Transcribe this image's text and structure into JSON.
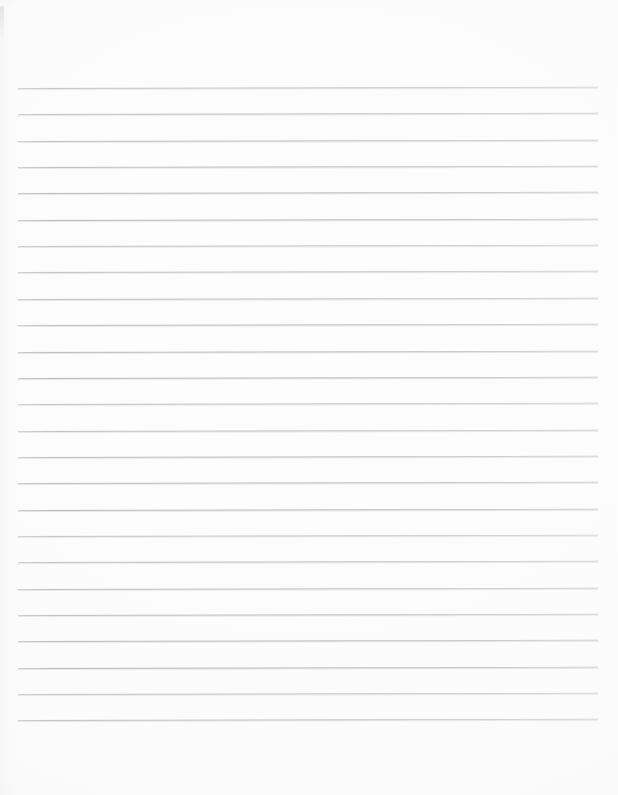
{
  "document": {
    "kind": "scanned-lined-paper",
    "title": "Blank Ruled Notebook Page",
    "page_width": 618,
    "page_height": 795,
    "orientation": "portrait",
    "content_text": "",
    "has_handwriting": false,
    "has_printed_text": false
  },
  "colors": {
    "page_background": "#fdfdfd",
    "rule_line": "#b9b9bd",
    "rule_line_shadow": "#dedee2",
    "edge_artifact": "#e4e4e8"
  },
  "ruling": {
    "style": "horizontal-ruled",
    "line_count": 25,
    "first_line_y": 88,
    "last_line_y": 720,
    "line_spacing": 26.35,
    "line_start_x": 18,
    "line_end_x": 598,
    "line_thickness": 1,
    "skew_degrees": -0.12,
    "has_margin_rule": false,
    "top_margin": 88,
    "bottom_margin": 75,
    "left_margin": 18,
    "right_margin": 20
  }
}
